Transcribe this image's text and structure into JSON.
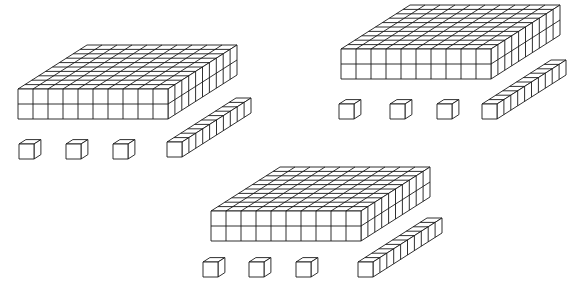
{
  "diagram": {
    "title": "Base-ten blocks",
    "cube_size": 15,
    "depth_step": [
      6.9,
      -4.4
    ],
    "groups": [
      {
        "id": "group-top-left",
        "value_shown": "2 hundreds, 1 ten, 3 ones",
        "flat": {
          "x": 18,
          "y": 89,
          "cols": 10,
          "rows": 10,
          "layers": 2,
          "count": 2
        },
        "rod": {
          "x": 167,
          "y": 142,
          "length": 10,
          "count": 1
        },
        "units": [
          {
            "x": 19,
            "y": 144
          },
          {
            "x": 66,
            "y": 144
          },
          {
            "x": 113,
            "y": 144
          }
        ]
      },
      {
        "id": "group-top-right",
        "value_shown": "2 hundreds, 1 ten, 3 ones",
        "flat": {
          "x": 341,
          "y": 49,
          "cols": 10,
          "rows": 10,
          "layers": 2,
          "count": 2
        },
        "rod": {
          "x": 482,
          "y": 104,
          "length": 10,
          "count": 1
        },
        "units": [
          {
            "x": 339,
            "y": 104
          },
          {
            "x": 390,
            "y": 104
          },
          {
            "x": 437,
            "y": 104
          }
        ]
      },
      {
        "id": "group-bottom-center",
        "value_shown": "2 hundreds, 1 ten, 3 ones",
        "flat": {
          "x": 211,
          "y": 211,
          "cols": 10,
          "rows": 10,
          "layers": 2,
          "count": 2
        },
        "rod": {
          "x": 358,
          "y": 262,
          "length": 10,
          "count": 1
        },
        "units": [
          {
            "x": 203,
            "y": 262
          },
          {
            "x": 249,
            "y": 262
          },
          {
            "x": 296,
            "y": 262
          }
        ]
      }
    ],
    "colors": {
      "stroke": "#1a1a1a",
      "fill": "#ffffff",
      "background": "#ffffff"
    }
  }
}
